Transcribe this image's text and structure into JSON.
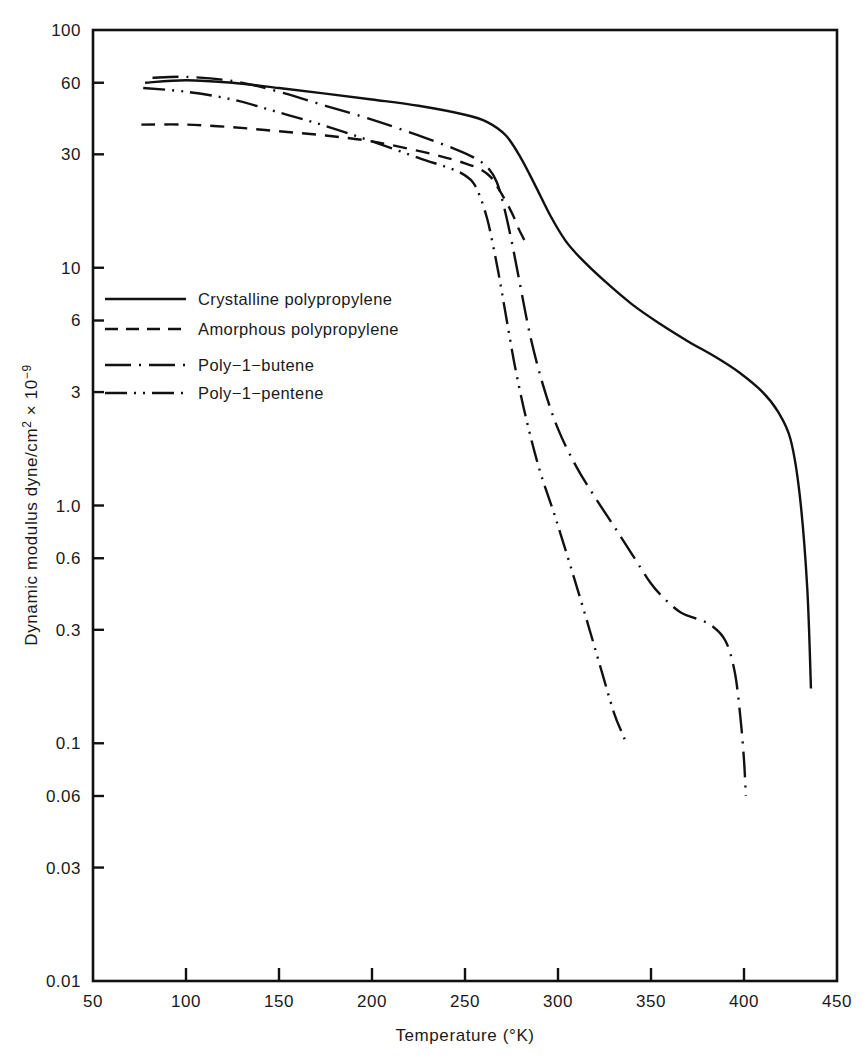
{
  "chart_data": {
    "type": "line",
    "title": "",
    "xlabel": "Temperature (°K)",
    "ylabel": "Dynamic modulus dyne/cm² × 10⁻⁹",
    "ylabel_parts": {
      "main": "Dynamic modulus dyne/cm",
      "sup1": "2",
      "times": " × 10",
      "sup2": "−9"
    },
    "xlim": [
      50,
      450
    ],
    "ylim": [
      0.01,
      100
    ],
    "yscale": "log",
    "grid": false,
    "legend_position": "center-left-inside",
    "xticks": [
      50,
      100,
      150,
      200,
      250,
      300,
      350,
      400,
      450
    ],
    "xtick_labels": [
      "50",
      "100",
      "150",
      "200",
      "250",
      "300",
      "350",
      "400",
      "450"
    ],
    "yticks": [
      100,
      60,
      30,
      10,
      6,
      3,
      1.0,
      0.6,
      0.3,
      0.1,
      0.06,
      0.03,
      0.01
    ],
    "ytick_labels": [
      "100",
      "60",
      "30",
      "10",
      "6",
      "3",
      "1.0",
      "0.6",
      "0.3",
      "0.1",
      "0.06",
      "0.03",
      "0.01"
    ],
    "series": [
      {
        "name": "Crystalline polypropylene",
        "style": "solid",
        "dash": "none",
        "color": "#111111",
        "x": [
          78,
          100,
          125,
          150,
          175,
          200,
          225,
          250,
          262,
          272,
          280,
          288,
          296,
          304,
          312,
          325,
          340,
          355,
          370,
          385,
          398,
          410,
          418,
          425,
          430,
          434,
          436
        ],
        "y": [
          60.0,
          61.5,
          60.0,
          57.0,
          54.0,
          51.0,
          48.0,
          44.0,
          41.0,
          36.0,
          29.0,
          22.0,
          16.5,
          13.0,
          11.0,
          8.8,
          7.0,
          5.8,
          4.9,
          4.2,
          3.6,
          3.0,
          2.5,
          1.9,
          1.1,
          0.45,
          0.17
        ]
      },
      {
        "name": "Amorphous polypropylene",
        "style": "dashed",
        "dash": "14,9",
        "color": "#111111",
        "x": [
          76,
          100,
          125,
          150,
          175,
          200,
          225,
          240,
          250,
          258,
          264,
          268,
          272,
          276,
          279,
          281,
          282
        ],
        "y": [
          40.0,
          40.0,
          39.0,
          37.5,
          36.0,
          34.0,
          31.0,
          29.0,
          27.5,
          26.0,
          24.0,
          21.5,
          19.0,
          16.5,
          14.5,
          13.5,
          13.0
        ]
      },
      {
        "name": "Poly−1−butene",
        "style": "dash-dot",
        "dash": "26,8,2,8",
        "color": "#111111",
        "x": [
          82,
          100,
          125,
          150,
          175,
          200,
          225,
          245,
          255,
          262,
          267,
          271,
          275,
          279,
          285,
          292,
          300,
          310,
          320,
          330,
          340,
          350,
          358,
          366,
          374,
          382,
          390,
          395,
          398,
          400,
          401
        ],
        "y": [
          63.0,
          63.5,
          61.0,
          55.0,
          48.0,
          42.0,
          36.0,
          31.5,
          29.0,
          26.5,
          23.0,
          18.0,
          13.0,
          9.0,
          5.2,
          3.2,
          2.1,
          1.45,
          1.08,
          0.82,
          0.62,
          0.47,
          0.4,
          0.355,
          0.335,
          0.315,
          0.27,
          0.2,
          0.13,
          0.085,
          0.06
        ]
      },
      {
        "name": "Poly−1−pentene",
        "style": "dash-dot-dot",
        "dash": "22,7,2,7,2,7",
        "color": "#111111",
        "x": [
          77,
          100,
          125,
          150,
          175,
          200,
          225,
          240,
          248,
          254,
          258,
          262,
          265,
          268,
          272,
          277,
          283,
          290,
          298,
          306,
          314,
          322,
          330,
          335,
          337
        ],
        "y": [
          57.0,
          55.0,
          51.0,
          45.0,
          39.5,
          34.0,
          29.0,
          26.5,
          25.0,
          23.0,
          20.0,
          16.0,
          12.5,
          9.5,
          6.3,
          3.8,
          2.3,
          1.42,
          0.92,
          0.58,
          0.36,
          0.22,
          0.135,
          0.108,
          0.098
        ]
      }
    ],
    "legend": [
      {
        "label": "Crystalline polypropylene",
        "style": "solid",
        "dash": "none"
      },
      {
        "label": "Amorphous polypropylene",
        "style": "dashed",
        "dash": "13,8"
      },
      {
        "label": "Poly−1−butene",
        "style": "dash-dot",
        "dash": "26,8,2,8"
      },
      {
        "label": "Poly−1−pentene",
        "style": "dash-dot-dot",
        "dash": "22,7,2,7,2,7"
      }
    ]
  }
}
